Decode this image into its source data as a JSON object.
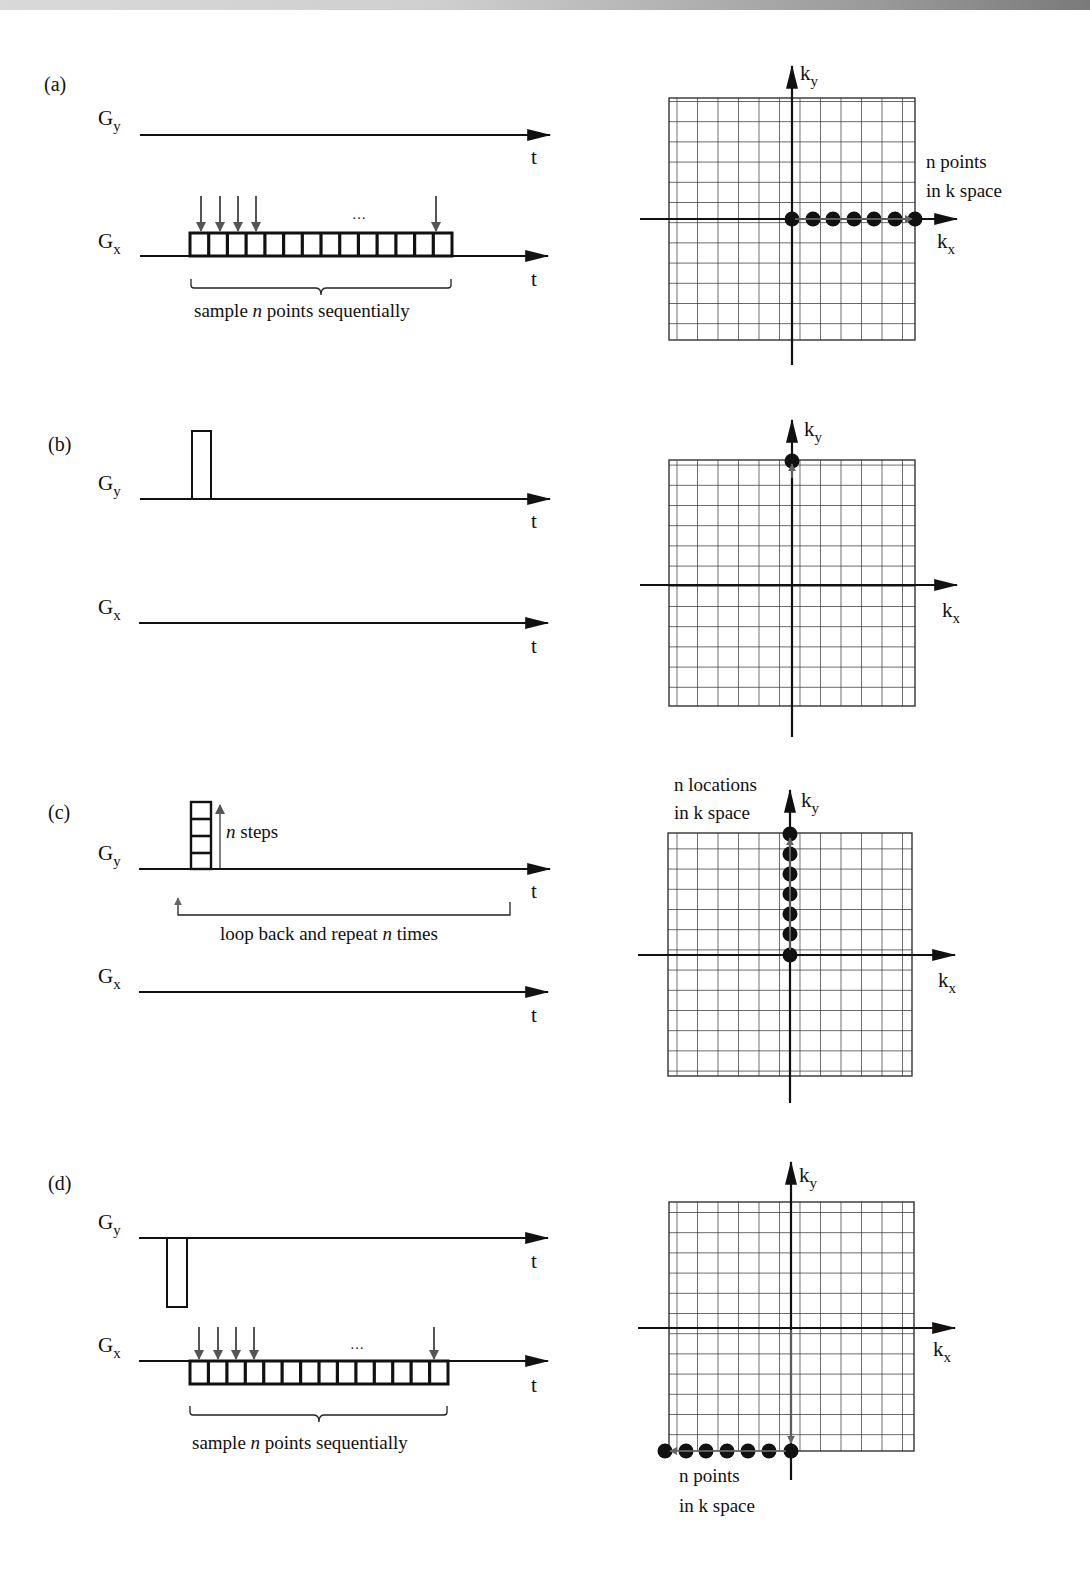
{
  "figure": {
    "colors": {
      "ink": "#111111",
      "grid": "#333333",
      "sample_arrow": "#555555",
      "traj_arrow": "#666666",
      "top_strip": "#bdbdbd"
    },
    "labels": {
      "Gy_main": "G",
      "Gy_sub": "y",
      "Gx_main": "G",
      "Gx_sub": "x",
      "time": "t",
      "ky_main": "k",
      "ky_sub": "y",
      "kx_main": "k",
      "kx_sub": "x",
      "ellipsis": "…"
    },
    "panels": [
      {
        "id": "a",
        "label": "(a)",
        "gy_pulse": "none",
        "gx_readout": {
          "cells": 14,
          "arrows_at_cells": [
            1,
            2,
            3,
            4,
            14
          ],
          "position": "above-axis"
        },
        "brace_text_pre": "sample ",
        "brace_text_n": "n",
        "brace_text_post": " points sequentially",
        "kspace": {
          "grid_cols": 12,
          "grid_rows": 12,
          "samples": "7 points along +kx from origin",
          "note_line1": "n points",
          "note_line2": "in k space"
        }
      },
      {
        "id": "b",
        "label": "(b)",
        "gy_pulse": "positive single lobe",
        "gx_readout": null,
        "kspace": {
          "grid_cols": 12,
          "grid_rows": 12,
          "samples": "1 point at top of ky axis",
          "trajectory": "move up ky axis"
        }
      },
      {
        "id": "c",
        "label": "(c)",
        "gy_pulse": "stepped phase encode (4 steps shown)",
        "steps_text_n": "n",
        "steps_text": " steps",
        "loop_text_pre": "loop back and repeat ",
        "loop_text_n": "n",
        "loop_text_post": " times",
        "gx_readout": null,
        "kspace": {
          "grid_cols": 12,
          "grid_rows": 12,
          "samples": "7 locations along +ky from origin",
          "note_line1": "n locations",
          "note_line2": "in k space"
        }
      },
      {
        "id": "d",
        "label": "(d)",
        "gy_pulse": "negative single lobe",
        "gx_readout": {
          "cells": 14,
          "arrows_at_cells": [
            1,
            2,
            3,
            4,
            14
          ],
          "position": "below-axis"
        },
        "brace_text_pre": "sample ",
        "brace_text_n": "n",
        "brace_text_post": " points sequentially",
        "kspace": {
          "grid_cols": 12,
          "grid_rows": 12,
          "samples": "7 points along bottom edge, moving -kx",
          "note_line1": "n points",
          "note_line2": "in k space"
        }
      }
    ]
  }
}
